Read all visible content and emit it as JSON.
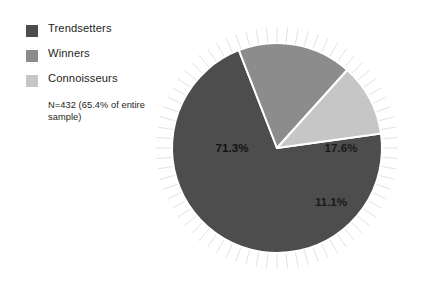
{
  "legend": {
    "items": [
      {
        "label": "Trendsetters",
        "color": "#4d4d4d",
        "swatch_name": "legend-swatch-trendsetters"
      },
      {
        "label": "Winners",
        "color": "#8c8c8c",
        "swatch_name": "legend-swatch-winners"
      },
      {
        "label": "Connoisseurs",
        "color": "#c6c6c6",
        "swatch_name": "legend-swatch-connoisseurs"
      }
    ]
  },
  "note": {
    "text": "N=432 (65.4% of entire sample)"
  },
  "chart_data": {
    "type": "pie",
    "title": "",
    "subtitle": "",
    "categories": [
      "Trendsetters",
      "Winners",
      "Connoisseurs"
    ],
    "values": [
      71.3,
      17.6,
      11.1
    ],
    "value_labels": [
      "71.3%",
      "17.6%",
      "11.1%"
    ],
    "colors": [
      "#4d4d4d",
      "#8c8c8c",
      "#c6c6c6"
    ],
    "units": "percent",
    "total_n": 432,
    "annotation": "N=432 (65.4% of entire sample)",
    "legend_position": "left",
    "grid": false,
    "start_angle_deg": -8,
    "direction": "clockwise",
    "slice_gap_color": "#ffffff",
    "background": "#ffffff",
    "decoration": "radial-rays",
    "ray_color": "#e2e2e2",
    "ray_count": 72,
    "geometry": {
      "cx": 277,
      "cy": 148,
      "r": 105
    },
    "label_positions": [
      {
        "label": "71.3%",
        "x": 232,
        "y": 152
      },
      {
        "label": "17.6%",
        "x": 341,
        "y": 152
      },
      {
        "label": "11.1%",
        "x": 331,
        "y": 206
      }
    ]
  }
}
